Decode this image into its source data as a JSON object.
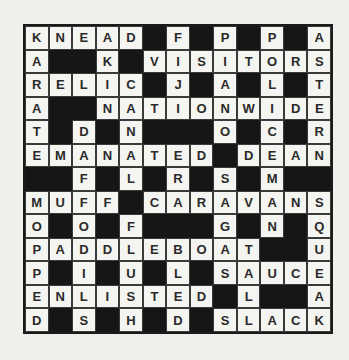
{
  "puzzle": {
    "type": "crossword",
    "size": 13,
    "rows": [
      "KNEAD#F#P#P#A",
      "A##K#VISITORS",
      "RELIC#J#A#L#T",
      "A##NATIONWIDE",
      "T#D#N###O#C#R",
      "EMANATED#DEAN",
      "##F#L#R#S#M##",
      "MUFF#CARAVANS",
      "O#O#F###G#N#Q",
      "PADDLEBOAT##U",
      "P#I#U#L#SAUCE",
      "ENLISTED#L##A",
      "D#S#H#D#SLACK"
    ],
    "across": [
      "KNEAD",
      "VISITORS",
      "RELIC",
      "NATIONWIDE",
      "EMANATED",
      "DEAN",
      "MUFF",
      "CARAVANS",
      "PADDLEBOAT",
      "SAUCE",
      "ENLISTED",
      "SLACK"
    ],
    "down": [
      "KARATE",
      "AKIN",
      "DANA",
      "FIJI",
      "PIANO",
      "POLICEMAN",
      "ASTERN",
      "DAFFODIL",
      "NATAL",
      "ERRS",
      "SAGAS",
      "MOPPED",
      "FLUSH",
      "BLED",
      "QUAKE",
      "SAUCE"
    ]
  },
  "colors": {
    "background": "#efefeb",
    "cell": "#f4f4f0",
    "block": "#161616",
    "letter": "#2a2a2a"
  }
}
